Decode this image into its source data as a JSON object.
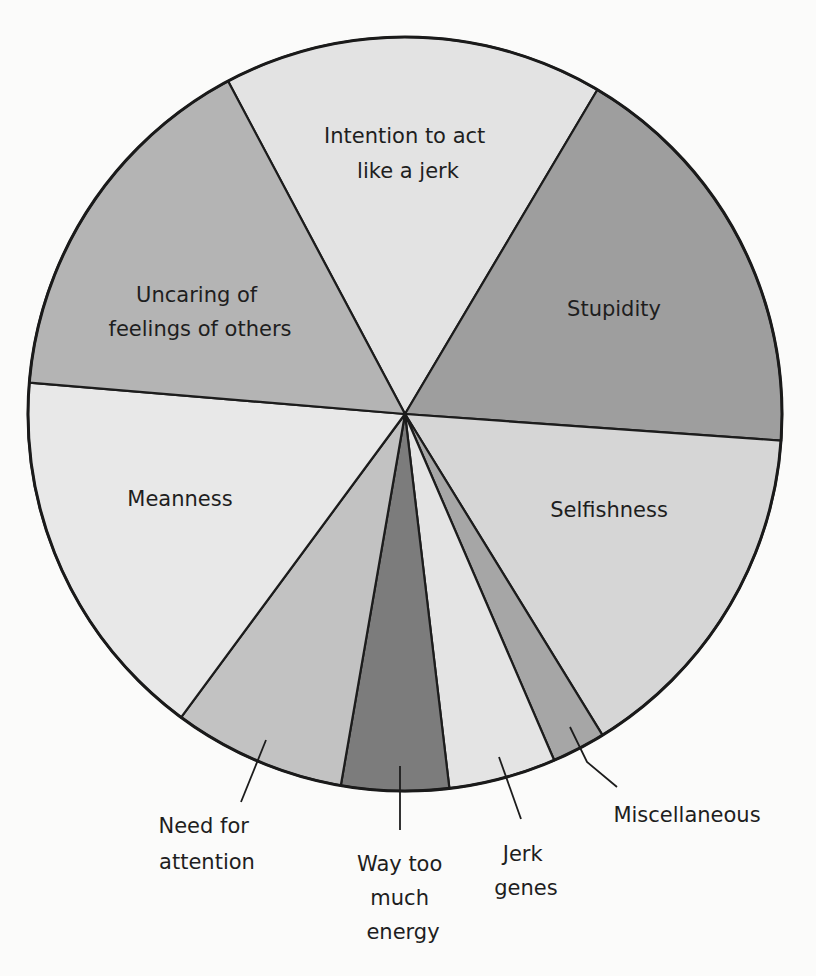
{
  "chart_data": {
    "type": "pie",
    "title": "",
    "center": [
      405,
      414
    ],
    "radius": 377,
    "start_angle_deg": 332,
    "categories": [
      "Intention to act like a jerk",
      "Stupidity",
      "Selfishness",
      "Miscellaneous",
      "Jerk genes",
      "Way too much energy",
      "Need for attention",
      "Meanness",
      "Uncaring of feelings of others"
    ],
    "values": [
      16.3,
      17.6,
      15.1,
      2.3,
      4.6,
      4.6,
      7.4,
      16.2,
      15.9
    ],
    "colors": [
      "#e3e3e3",
      "#9e9e9e",
      "#d6d6d6",
      "#a6a6a6",
      "#e4e4e4",
      "#7c7c7c",
      "#c2c2c2",
      "#e8e8e8",
      "#b4b4b4"
    ],
    "unit": "percent (estimated from slice angles)",
    "legend": "none (labels placed on/next to slices)"
  },
  "labels": {
    "intention": [
      "Intention to act",
      "like a jerk"
    ],
    "stupidity": [
      "Stupidity"
    ],
    "selfishness": [
      "Selfishness"
    ],
    "miscellaneous": [
      "Miscellaneous"
    ],
    "jerk_genes": [
      "Jerk",
      "genes"
    ],
    "energy": [
      "Way too",
      "much",
      "energy"
    ],
    "need_attention": [
      "Need for",
      "attention"
    ],
    "meanness": [
      "Meanness"
    ],
    "uncaring": [
      "Uncaring of",
      "feelings of others"
    ]
  }
}
